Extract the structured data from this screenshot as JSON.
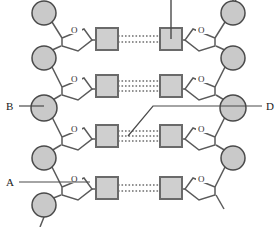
{
  "figure": {
    "name": "dna-double-helix-ladder-diagram",
    "width": 277,
    "height": 227,
    "background_color": "#ffffff"
  },
  "colors": {
    "phosphate_fill": "#c9c9c9",
    "phosphate_stroke": "#4a4a4a",
    "base_fill": "#cfcfcf",
    "base_stroke": "#6a6a6a",
    "sugar_stroke": "#5a5a5a",
    "bond_stroke": "#555555",
    "hbond_stroke": "#6e6e6e",
    "label_color": "#1a1a1a",
    "leader_stroke": "#4a4a4a"
  },
  "labels": [
    {
      "id": "label-b",
      "text": "B",
      "x": 8,
      "y": 108,
      "points_to": "phosphate-left-3"
    },
    {
      "id": "label-a",
      "text": "A",
      "x": 8,
      "y": 184,
      "points_to": "sugar-left-4-carbon"
    },
    {
      "id": "label-d",
      "text": "D",
      "x": 266,
      "y": 108,
      "points_to": "hydrogen-bonds-pair-3"
    }
  ],
  "unlabeled_leaders": [
    {
      "id": "leader-top-base",
      "from": "base-right-1",
      "direction": "up",
      "x": 177,
      "y_top": 0,
      "y_bottom": 20
    }
  ],
  "sugar_ring_label": "O",
  "left_strand": {
    "name": "left-sugar-phosphate-backbone",
    "phosphates": [
      {
        "id": "phosphate-left-1",
        "cx": 44,
        "cy": 13,
        "r": 12
      },
      {
        "id": "phosphate-left-2",
        "cx": 44,
        "cy": 58,
        "r": 12
      },
      {
        "id": "phosphate-left-3",
        "cx": 44,
        "cy": 108,
        "r": 13
      },
      {
        "id": "phosphate-left-4",
        "cx": 44,
        "cy": 158,
        "r": 12
      },
      {
        "id": "phosphate-left-5",
        "cx": 44,
        "cy": 205,
        "r": 12
      }
    ],
    "sugars": [
      {
        "id": "sugar-left-1",
        "cy": 33
      },
      {
        "id": "sugar-left-2",
        "cy": 82
      },
      {
        "id": "sugar-left-3",
        "cy": 132
      },
      {
        "id": "sugar-left-4",
        "cy": 182
      }
    ]
  },
  "right_strand": {
    "name": "right-sugar-phosphate-backbone",
    "phosphates": [
      {
        "id": "phosphate-right-1",
        "cx": 233,
        "cy": 13,
        "r": 12
      },
      {
        "id": "phosphate-right-2",
        "cx": 233,
        "cy": 58,
        "r": 12
      },
      {
        "id": "phosphate-right-3",
        "cx": 233,
        "cy": 108,
        "r": 13
      },
      {
        "id": "phosphate-right-4",
        "cx": 233,
        "cy": 158,
        "r": 12
      }
    ],
    "sugars": [
      {
        "id": "sugar-right-1",
        "cy": 33
      },
      {
        "id": "sugar-right-2",
        "cy": 82
      },
      {
        "id": "sugar-right-3",
        "cy": 132
      },
      {
        "id": "sugar-right-4",
        "cy": 182
      }
    ]
  },
  "base_pairs": [
    {
      "id": "base-pair-1",
      "cy": 33,
      "hydrogen_bonds": 2
    },
    {
      "id": "base-pair-2",
      "cy": 80,
      "hydrogen_bonds": 3
    },
    {
      "id": "base-pair-3",
      "cy": 130,
      "hydrogen_bonds": 3
    },
    {
      "id": "base-pair-4",
      "cy": 180,
      "hydrogen_bonds": 2
    }
  ],
  "base_square": {
    "left_x": 96,
    "right_x": 160,
    "size": 22
  }
}
